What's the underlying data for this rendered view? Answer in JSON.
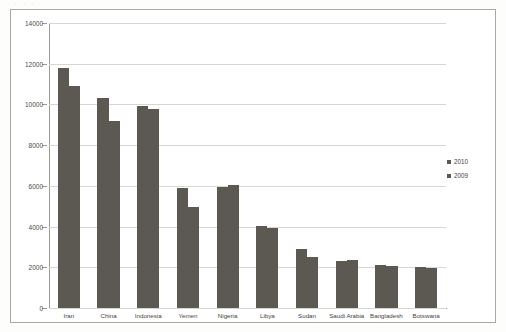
{
  "page": {
    "title_ghost": "·     ·     ·"
  },
  "legend": {
    "position": "right",
    "items": [
      {
        "label": "2010",
        "color": "#5c5952"
      },
      {
        "label": "2009",
        "color": "#5c5952"
      }
    ]
  },
  "axis": {
    "y_ticks": [
      "0",
      "2000",
      "4000",
      "6000",
      "8000",
      "10000",
      "12000",
      "14000"
    ]
  },
  "chart_data": {
    "type": "bar",
    "title": "",
    "subtitle": "",
    "xlabel": "",
    "ylabel": "",
    "ylim": [
      0,
      14000
    ],
    "ytick_step": 2000,
    "grid": true,
    "legend_position": "right",
    "bar_color": "#5c5952",
    "categories": [
      "Iran",
      "China",
      "Indonesia",
      "Yemen",
      "Nigeria",
      "Libya",
      "Sudan",
      "Saudi Arabia",
      "Bangladesh",
      "Botswana"
    ],
    "series": [
      {
        "name": "2010",
        "values": [
          11800,
          10300,
          9900,
          5900,
          5950,
          4050,
          2900,
          2300,
          2100,
          2000
        ]
      },
      {
        "name": "2009",
        "values": [
          10900,
          9200,
          9800,
          4950,
          6050,
          3950,
          2500,
          2350,
          2050,
          1950
        ]
      }
    ]
  }
}
